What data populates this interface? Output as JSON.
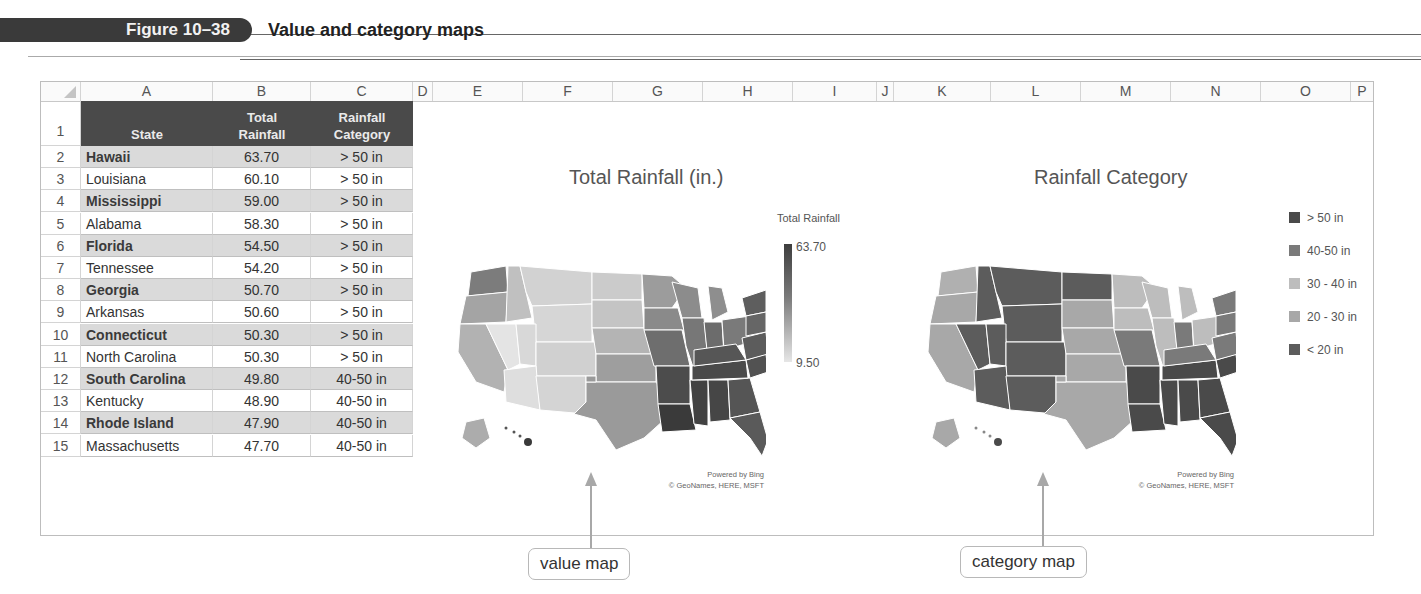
{
  "figure": {
    "label": "Figure 10–38",
    "title": "Value and category maps"
  },
  "sheet": {
    "columns": [
      "A",
      "B",
      "C",
      "D",
      "E",
      "F",
      "G",
      "H",
      "I",
      "J",
      "K",
      "L",
      "M",
      "N",
      "O",
      "P"
    ],
    "header": {
      "row_number": "1",
      "state": "State",
      "total_rainfall_line1": "Total",
      "total_rainfall_line2": "Rainfall",
      "category_line1": "Rainfall",
      "category_line2": "Category"
    },
    "rows": [
      {
        "n": "2",
        "state": "Hawaii",
        "rain": "63.70",
        "cat": "> 50 in"
      },
      {
        "n": "3",
        "state": "Louisiana",
        "rain": "60.10",
        "cat": "> 50 in"
      },
      {
        "n": "4",
        "state": "Mississippi",
        "rain": "59.00",
        "cat": "> 50 in"
      },
      {
        "n": "5",
        "state": "Alabama",
        "rain": "58.30",
        "cat": "> 50 in"
      },
      {
        "n": "6",
        "state": "Florida",
        "rain": "54.50",
        "cat": "> 50 in"
      },
      {
        "n": "7",
        "state": "Tennessee",
        "rain": "54.20",
        "cat": "> 50 in"
      },
      {
        "n": "8",
        "state": "Georgia",
        "rain": "50.70",
        "cat": "> 50 in"
      },
      {
        "n": "9",
        "state": "Arkansas",
        "rain": "50.60",
        "cat": "> 50 in"
      },
      {
        "n": "10",
        "state": "Connecticut",
        "rain": "50.30",
        "cat": "> 50 in"
      },
      {
        "n": "11",
        "state": "North Carolina",
        "rain": "50.30",
        "cat": "> 50 in"
      },
      {
        "n": "12",
        "state": "South Carolina",
        "rain": "49.80",
        "cat": "40-50 in"
      },
      {
        "n": "13",
        "state": "Kentucky",
        "rain": "48.90",
        "cat": "40-50 in"
      },
      {
        "n": "14",
        "state": "Rhode Island",
        "rain": "47.90",
        "cat": "40-50 in"
      },
      {
        "n": "15",
        "state": "Massachusetts",
        "rain": "47.70",
        "cat": "40-50 in"
      }
    ]
  },
  "value_map": {
    "title": "Total Rainfall (in.)",
    "legend_title": "Total Rainfall",
    "max_label": "63.70",
    "min_label": "9.50",
    "credit_line1": "Powered by Bing",
    "credit_line2": "© GeoNames, HERE, MSFT",
    "colors": {
      "max": "#3e3e3e",
      "min": "#e6e6e6"
    }
  },
  "category_map": {
    "title": "Rainfall Category",
    "legend": [
      {
        "label": "> 50 in",
        "color": "#4a4a4a"
      },
      {
        "label": "40-50 in",
        "color": "#7a7a7a"
      },
      {
        "label": "30 - 40 in",
        "color": "#bdbdbd"
      },
      {
        "label": "20 - 30 in",
        "color": "#a8a8a8"
      },
      {
        "label": "< 20 in",
        "color": "#5c5c5c"
      }
    ],
    "credit_line1": "Powered by Bing",
    "credit_line2": "© GeoNames, HERE, MSFT"
  },
  "callouts": {
    "value": "value map",
    "category": "category map"
  }
}
